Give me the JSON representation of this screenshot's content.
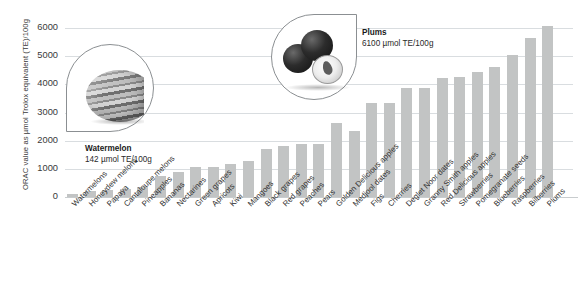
{
  "chart_data": {
    "type": "bar",
    "title": "",
    "xlabel": "",
    "ylabel": "ORAC value as µmol Trolox equivalent (TE)/100g",
    "ylim": [
      0,
      6500
    ],
    "yticks": [
      0,
      1000,
      2000,
      3000,
      4000,
      5000,
      6000
    ],
    "grid": true,
    "legend": "none",
    "bar_color": "#c2c4c4",
    "categories": [
      "Watermelons",
      "Honeydew melons",
      "Papaya",
      "Cantaloupe melons",
      "Pineapples",
      "Bananas",
      "Nectarines",
      "Green grapes",
      "Apricots",
      "Kiwi",
      "Mangoes",
      "Black grapes",
      "Red grapes",
      "Peaches",
      "Pears",
      "Golden Delicious apples",
      "Medjool dates",
      "Figs",
      "Cherries",
      "Deglet Noor dates",
      "Granny Smith apples",
      "Red Delicious apples",
      "Strawberries",
      "Pomegranate seeds",
      "Blueberries",
      "Raspberries",
      "Bilberries",
      "Plums"
    ],
    "values": [
      142,
      241,
      300,
      319,
      385,
      795,
      919,
      1118,
      1115,
      1210,
      1300,
      1746,
      1837,
      1922,
      1911,
      2670,
      2387,
      3383,
      3365,
      3895,
      3898,
      4275,
      4302,
      4479,
      4669,
      5065,
      5700,
      6100
    ]
  },
  "annotations": [
    {
      "id": "watermelon",
      "name": "Watermelon",
      "value": "142 µmol TE/100g",
      "photo": "watermelon-photo"
    },
    {
      "id": "plums",
      "name": "Plums",
      "value": "6100 µmol TE/100g",
      "photo": "plums-photo"
    }
  ]
}
